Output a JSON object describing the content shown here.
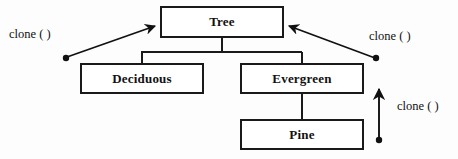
{
  "diagram": {
    "kind": "class-inheritance-diagram",
    "background_color": "#fdfdfd",
    "line_color": "#1a1a1a",
    "nodes": [
      {
        "id": "tree",
        "label": "Tree",
        "x": 160,
        "y": 6,
        "w": 124,
        "h": 32
      },
      {
        "id": "deciduous",
        "label": "Deciduous",
        "x": 80,
        "y": 63,
        "w": 124,
        "h": 31
      },
      {
        "id": "evergreen",
        "label": "Evergreen",
        "x": 240,
        "y": 63,
        "w": 124,
        "h": 31
      },
      {
        "id": "pine",
        "label": "Pine",
        "x": 240,
        "y": 119,
        "w": 124,
        "h": 31
      }
    ],
    "edges": [
      {
        "from": "tree",
        "to": "deciduous",
        "style": "orthogonal-tree-connector"
      },
      {
        "from": "tree",
        "to": "evergreen",
        "style": "orthogonal-tree-connector"
      },
      {
        "from": "evergreen",
        "to": "pine",
        "style": "orthogonal-tree-connector"
      }
    ],
    "annotations": [
      {
        "id": "clone-left",
        "label": "clone ( )",
        "arrow": "diagonal-up-right",
        "target": "tree"
      },
      {
        "id": "clone-right",
        "label": "clone ( )",
        "arrow": "diagonal-up-left",
        "target": "tree"
      },
      {
        "id": "clone-bottom",
        "label": "clone ( )",
        "arrow": "vertical-up",
        "target": "evergreen"
      }
    ]
  }
}
